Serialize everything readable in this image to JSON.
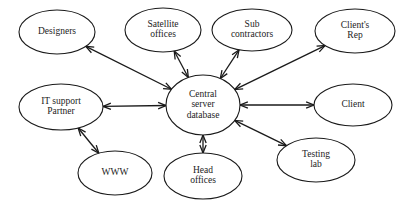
{
  "diagram": {
    "type": "node-link-diagram",
    "background_color": "#ffffff",
    "line_color": "#1a1a1a",
    "text_color": "#1c1c1c",
    "nodes": [
      {
        "id": "designers",
        "label": "Designers",
        "lines": [
          "Designers"
        ],
        "cx": 57,
        "cy": 32,
        "rx": 38,
        "ry": 22
      },
      {
        "id": "satellite-offices",
        "label": "Satellite offices",
        "lines": [
          "Satellite",
          "offices"
        ],
        "cx": 163,
        "cy": 30,
        "rx": 38,
        "ry": 22
      },
      {
        "id": "sub-contractors",
        "label": "Sub contractors",
        "lines": [
          "Sub",
          "contractors"
        ],
        "cx": 252,
        "cy": 30,
        "rx": 40,
        "ry": 21
      },
      {
        "id": "clients-rep",
        "label": "Client's Rep",
        "lines": [
          "Client's",
          "Rep"
        ],
        "cx": 355,
        "cy": 31,
        "rx": 40,
        "ry": 22
      },
      {
        "id": "it-support-partner",
        "label": "IT support Partner",
        "lines": [
          "IT support",
          "Partner"
        ],
        "cx": 61,
        "cy": 107,
        "rx": 42,
        "ry": 23
      },
      {
        "id": "central-server-database",
        "label": "Central server database",
        "lines": [
          "Central",
          "server",
          "database"
        ],
        "cx": 203,
        "cy": 105,
        "rx": 37,
        "ry": 30
      },
      {
        "id": "client",
        "label": "Client",
        "lines": [
          "Client"
        ],
        "cx": 353,
        "cy": 105,
        "rx": 39,
        "ry": 21
      },
      {
        "id": "www",
        "label": "WWW",
        "lines": [
          "WWW"
        ],
        "cx": 115,
        "cy": 173,
        "rx": 37,
        "ry": 22
      },
      {
        "id": "head-offices",
        "label": "Head offices",
        "lines": [
          "Head",
          "offices"
        ],
        "cx": 203,
        "cy": 176,
        "rx": 39,
        "ry": 23
      },
      {
        "id": "testing-lab",
        "label": "Testing lab",
        "lines": [
          "Testing",
          "lab"
        ],
        "cx": 316,
        "cy": 160,
        "rx": 39,
        "ry": 22
      }
    ],
    "edges": [
      {
        "id": "edge-center-designers",
        "from": "central-server-database",
        "to": "designers",
        "arrow": "double"
      },
      {
        "id": "edge-center-satellite-offices",
        "from": "central-server-database",
        "to": "satellite-offices",
        "arrow": "double"
      },
      {
        "id": "edge-center-sub-contractors",
        "from": "central-server-database",
        "to": "sub-contractors",
        "arrow": "double"
      },
      {
        "id": "edge-center-clients-rep",
        "from": "central-server-database",
        "to": "clients-rep",
        "arrow": "double"
      },
      {
        "id": "edge-center-it-support-partner",
        "from": "central-server-database",
        "to": "it-support-partner",
        "arrow": "double"
      },
      {
        "id": "edge-center-client",
        "from": "central-server-database",
        "to": "client",
        "arrow": "double"
      },
      {
        "id": "edge-center-head-offices",
        "from": "central-server-database",
        "to": "head-offices",
        "arrow": "double"
      },
      {
        "id": "edge-center-testing-lab",
        "from": "central-server-database",
        "to": "testing-lab",
        "arrow": "double"
      },
      {
        "id": "edge-it-support-partner-www",
        "from": "it-support-partner",
        "to": "www",
        "arrow": "double"
      }
    ]
  }
}
